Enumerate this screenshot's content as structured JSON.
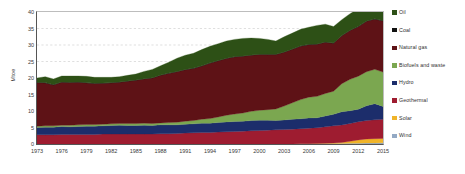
{
  "chart_data": {
    "type": "area",
    "title": "",
    "subtitle": "",
    "xlabel": "",
    "ylabel": "Mtoe",
    "xlim": [
      1973,
      2015
    ],
    "ylim": [
      0,
      40
    ],
    "grid": true,
    "grid_values": [
      25,
      30,
      35
    ],
    "legend_position": "right",
    "stacked": true,
    "stack_order_bottom_to_top": [
      "Wind",
      "Solar",
      "Geothermal",
      "Hydro",
      "Biofuels and waste",
      "Natural gas",
      "Coal",
      "Oil"
    ],
    "y_ticks": [
      0,
      5,
      10,
      15,
      20,
      25,
      30,
      35,
      40
    ],
    "x_ticks": [
      1973,
      1976,
      1979,
      1982,
      1985,
      1988,
      1991,
      1994,
      1997,
      2000,
      2003,
      2006,
      2009,
      2012,
      2015
    ],
    "x": [
      1973,
      1974,
      1975,
      1976,
      1977,
      1978,
      1979,
      1980,
      1981,
      1982,
      1983,
      1984,
      1985,
      1986,
      1987,
      1988,
      1989,
      1990,
      1991,
      1992,
      1993,
      1994,
      1995,
      1996,
      1997,
      1998,
      1999,
      2000,
      2001,
      2002,
      2003,
      2004,
      2005,
      2006,
      2007,
      2008,
      2009,
      2010,
      2011,
      2012,
      2013,
      2014,
      2015
    ],
    "series": [
      {
        "name": "Wind",
        "color": "#93a9c4",
        "values": [
          0.0,
          0.0,
          0.0,
          0.0,
          0.0,
          0.0,
          0.0,
          0.0,
          0.0,
          0.0,
          0.0,
          0.0,
          0.0,
          0.0,
          0.0,
          0.0,
          0.0,
          0.0,
          0.0,
          0.0,
          0.0,
          0.0,
          0.0,
          0.0,
          0.0,
          0.0,
          0.0,
          0.0,
          0.0,
          0.0,
          0.0,
          0.0,
          0.05,
          0.07,
          0.1,
          0.12,
          0.15,
          0.18,
          0.2,
          0.25,
          0.3,
          0.32,
          0.35
        ]
      },
      {
        "name": "Solar",
        "color": "#f0b429",
        "values": [
          0.0,
          0.0,
          0.0,
          0.0,
          0.0,
          0.0,
          0.0,
          0.0,
          0.0,
          0.0,
          0.0,
          0.0,
          0.0,
          0.0,
          0.0,
          0.0,
          0.0,
          0.0,
          0.0,
          0.0,
          0.0,
          0.0,
          0.0,
          0.0,
          0.0,
          0.0,
          0.0,
          0.0,
          0.0,
          0.0,
          0.0,
          0.0,
          0.0,
          0.02,
          0.04,
          0.08,
          0.15,
          0.3,
          0.6,
          1.0,
          1.2,
          1.3,
          1.35
        ]
      },
      {
        "name": "Geothermal",
        "color": "#9e1c30",
        "values": [
          2.8,
          2.8,
          2.8,
          2.9,
          2.9,
          2.9,
          2.9,
          2.9,
          3.0,
          3.0,
          3.0,
          3.0,
          3.0,
          3.0,
          3.0,
          3.1,
          3.1,
          3.2,
          3.3,
          3.4,
          3.5,
          3.5,
          3.6,
          3.7,
          3.8,
          3.9,
          4.0,
          4.1,
          4.2,
          4.3,
          4.4,
          4.5,
          4.6,
          4.7,
          4.8,
          5.0,
          5.2,
          5.3,
          5.4,
          5.5,
          5.6,
          5.7,
          5.8
        ]
      },
      {
        "name": "Hydro",
        "color": "#1c2d6b",
        "values": [
          2.2,
          2.3,
          2.3,
          2.4,
          2.3,
          2.4,
          2.5,
          2.5,
          2.5,
          2.6,
          2.7,
          2.6,
          2.6,
          2.7,
          2.6,
          2.7,
          2.7,
          2.6,
          2.7,
          2.7,
          2.8,
          2.8,
          2.9,
          3.0,
          3.0,
          3.0,
          3.1,
          3.1,
          3.0,
          2.8,
          2.9,
          3.0,
          3.0,
          3.1,
          3.0,
          3.3,
          3.5,
          4.0,
          3.9,
          3.8,
          4.5,
          4.9,
          3.9
        ]
      },
      {
        "name": "Biofuels and waste",
        "color": "#7ba750",
        "values": [
          0.4,
          0.4,
          0.4,
          0.4,
          0.5,
          0.5,
          0.5,
          0.5,
          0.5,
          0.5,
          0.5,
          0.6,
          0.6,
          0.6,
          0.6,
          0.6,
          0.7,
          0.8,
          0.9,
          1.0,
          1.2,
          1.4,
          1.7,
          2.0,
          2.3,
          2.5,
          2.8,
          3.0,
          3.2,
          3.5,
          4.2,
          5.0,
          5.8,
          6.3,
          6.5,
          6.8,
          7.0,
          8.5,
          9.5,
          10.0,
          10.3,
          10.4,
          10.4
        ]
      },
      {
        "name": "Natural gas",
        "color": "#5e1216",
        "values": [
          13.2,
          13.0,
          12.4,
          13.0,
          12.9,
          12.9,
          12.6,
          12.4,
          12.4,
          12.4,
          12.5,
          12.8,
          13.1,
          13.4,
          13.8,
          14.4,
          14.9,
          15.3,
          15.6,
          15.8,
          16.1,
          16.8,
          17.0,
          17.2,
          17.3,
          17.2,
          17.0,
          16.9,
          16.7,
          16.5,
          16.3,
          16.2,
          16.2,
          15.9,
          15.8,
          15.5,
          14.5,
          14.5,
          14.8,
          15.0,
          15.3,
          15.2,
          15.5
        ]
      },
      {
        "name": "Coal",
        "color": "#111111",
        "values": [
          0.1,
          0.1,
          0.1,
          0.1,
          0.1,
          0.1,
          0.1,
          0.1,
          0.1,
          0.1,
          0.1,
          0.1,
          0.1,
          0.1,
          0.1,
          0.1,
          0.1,
          0.1,
          0.1,
          0.1,
          0.1,
          0.1,
          0.1,
          0.1,
          0.1,
          0.1,
          0.1,
          0.1,
          0.1,
          0.1,
          0.1,
          0.1,
          0.1,
          0.1,
          0.1,
          0.1,
          0.1,
          0.1,
          0.1,
          0.1,
          0.1,
          0.1,
          0.1
        ]
      },
      {
        "name": "Oil",
        "color": "#2d5016",
        "values": [
          1.3,
          1.8,
          1.7,
          1.8,
          1.9,
          1.8,
          1.9,
          1.8,
          1.7,
          1.6,
          1.6,
          1.7,
          1.8,
          2.2,
          2.5,
          2.8,
          3.3,
          4.0,
          4.3,
          4.5,
          4.9,
          5.0,
          5.1,
          5.2,
          5.2,
          5.3,
          5.1,
          4.8,
          4.5,
          4.0,
          4.6,
          4.8,
          5.0,
          5.2,
          5.6,
          5.4,
          5.0,
          4.8,
          5.0,
          5.3,
          5.6,
          4.4,
          4.3
        ]
      }
    ]
  },
  "legend": {
    "items": [
      {
        "label": "Oil",
        "color": "#2d5016"
      },
      {
        "label": "Coal",
        "color": "#111111"
      },
      {
        "label": "Natural gas",
        "color": "#5e1216"
      },
      {
        "label": "Biofuels and waste",
        "color": "#7ba750"
      },
      {
        "label": "Hydro",
        "color": "#1c2d6b"
      },
      {
        "label": "Geothermal",
        "color": "#9e1c30"
      },
      {
        "label": "Solar",
        "color": "#f0b429"
      },
      {
        "label": "Wind",
        "color": "#93a9c4"
      }
    ]
  },
  "axes": {
    "y_title": "Mtoe",
    "y_tick_labels": [
      "0",
      "5",
      "10",
      "15",
      "20",
      "25",
      "30",
      "35",
      "40"
    ],
    "x_tick_labels": [
      "1973",
      "1976",
      "1979",
      "1982",
      "1985",
      "1988",
      "1991",
      "1994",
      "1997",
      "2000",
      "2003",
      "2006",
      "2009",
      "2012",
      "2015"
    ]
  },
  "style": {
    "axis_color": "#555555",
    "grid_color": "#c9c9c9",
    "text_color": "#3a3a3a",
    "background": "#ffffff"
  }
}
